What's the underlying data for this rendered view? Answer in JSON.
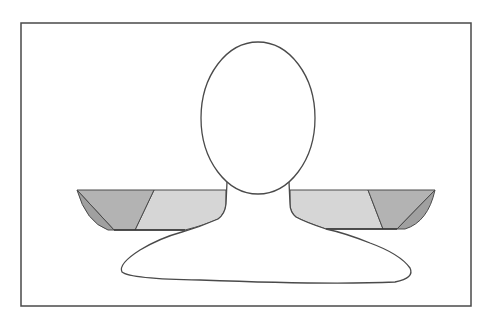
{
  "diagram": {
    "type": "figure-illustration",
    "colors": {
      "background": "#ffffff",
      "stroke": "#4a4a4a",
      "light_shade": "#d6d6d6",
      "mid_shade": "#b3b3b3",
      "dark_shade": "#a0a0a0"
    },
    "regions": [
      {
        "name": "head",
        "shape": "ellipse"
      },
      {
        "name": "neck-and-torso",
        "shape": "outline"
      },
      {
        "name": "left-shoulder-inner",
        "shade": "light"
      },
      {
        "name": "left-shoulder-middle",
        "shade": "mid"
      },
      {
        "name": "left-shoulder-outer",
        "shade": "dark"
      },
      {
        "name": "right-shoulder-inner",
        "shade": "light"
      },
      {
        "name": "right-shoulder-middle",
        "shade": "mid"
      },
      {
        "name": "right-shoulder-outer",
        "shade": "dark"
      }
    ]
  }
}
